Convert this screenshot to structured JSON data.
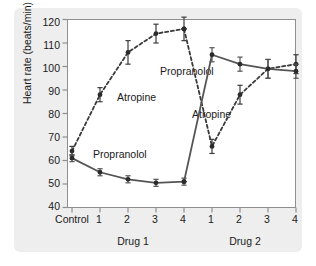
{
  "chart_data": {
    "type": "line",
    "title": "",
    "xlabel": "",
    "ylabel": "Heart rate (beats/min)",
    "ylim": [
      40,
      120
    ],
    "yticks": [
      40,
      50,
      60,
      70,
      80,
      90,
      100,
      110,
      120
    ],
    "grid": false,
    "legend_position": "inline-annotations",
    "categories": [
      "Control",
      "1",
      "2",
      "3",
      "4",
      "1",
      "2",
      "3",
      "4"
    ],
    "group_labels": [
      {
        "text": "Drug 1",
        "spans": [
          "1",
          "2",
          "3",
          "4"
        ]
      },
      {
        "text": "Drug 2",
        "spans": [
          "1",
          "2",
          "3",
          "4"
        ]
      }
    ],
    "series": [
      {
        "name": "Atropine",
        "style": "dashed",
        "color": "#3a3a3a",
        "marker": "circle",
        "values": [
          64,
          88,
          106,
          114,
          116,
          66,
          88,
          99,
          101
        ],
        "errors": [
          2,
          3,
          5,
          4,
          5,
          3,
          4,
          4,
          4
        ]
      },
      {
        "name": "Propranolol",
        "style": "solid",
        "color": "#555555",
        "marker": "circle",
        "values": [
          61,
          55,
          52,
          50.5,
          51,
          105,
          101,
          99,
          98
        ],
        "errors": [
          1.5,
          1.5,
          1.5,
          1.5,
          1.5,
          3,
          3,
          4,
          3
        ]
      }
    ],
    "annotations": [
      {
        "text": "Atropine",
        "series": "Atropine",
        "segment": "drug1",
        "x_px": 117,
        "y_px": 97
      },
      {
        "text": "Propranolol",
        "series": "Propranolol",
        "segment": "drug1",
        "x_px": 97,
        "y_px": 154
      },
      {
        "text": "Propranolol",
        "series": "Propranolol",
        "segment": "drug2",
        "x_px": 163,
        "y_px": 70
      },
      {
        "text": "Atropine",
        "series": "Atropine",
        "segment": "drug2",
        "x_px": 196,
        "y_px": 114
      }
    ]
  },
  "axis": {
    "y_tick_labels": [
      "120",
      "110",
      "100",
      "90",
      "80",
      "70",
      "60",
      "50",
      "40"
    ],
    "y_axis_title": "Heart rate (beats/min)",
    "x_tick_labels": [
      "Control",
      "1",
      "2",
      "3",
      "4",
      "1",
      "2",
      "3",
      "4"
    ],
    "x_group_1": "Drug 1",
    "x_group_2": "Drug 2"
  },
  "series_labels": {
    "atropine_1": "Atropine",
    "propranolol_1": "Propranolol",
    "propranolol_2": "Propranolol",
    "atropine_2": "Atropine"
  }
}
